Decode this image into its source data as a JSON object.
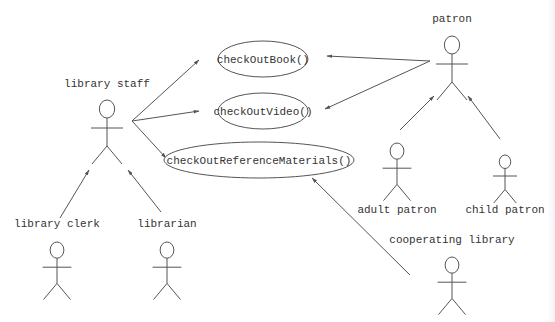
{
  "diagram": {
    "type": "UML use case diagram",
    "colors": {
      "line": "#555555",
      "text": "#333333",
      "background": "#ffffff"
    },
    "use_cases": [
      {
        "id": "checkOutBook",
        "label": "checkOutBook()",
        "cx": 263,
        "cy": 59,
        "rx": 45,
        "ry": 18
      },
      {
        "id": "checkOutVideo",
        "label": "checkOutVideo()",
        "cx": 263,
        "cy": 111,
        "rx": 45,
        "ry": 18
      },
      {
        "id": "checkOutReferenceMaterials",
        "label": "checkOutReferenceMaterials()",
        "cx": 259,
        "cy": 160,
        "rx": 95,
        "ry": 18
      }
    ],
    "actors": [
      {
        "id": "library-staff",
        "label": "library staff",
        "x": 107,
        "headY": 100,
        "scale": 1,
        "labelX": 107,
        "labelY": 87
      },
      {
        "id": "patron",
        "label": "patron",
        "x": 452,
        "headY": 36,
        "scale": 1,
        "labelX": 452,
        "labelY": 22
      },
      {
        "id": "library-clerk",
        "label": "library clerk",
        "x": 57,
        "headY": 242,
        "scale": 0.9,
        "labelX": 57,
        "labelY": 227
      },
      {
        "id": "librarian",
        "label": "librarian",
        "x": 167,
        "headY": 242,
        "scale": 0.9,
        "labelX": 167,
        "labelY": 227
      },
      {
        "id": "adult-patron",
        "label": "adult patron",
        "x": 397,
        "headY": 143,
        "scale": 0.9,
        "labelX": 397,
        "labelY": 213
      },
      {
        "id": "child-patron",
        "label": "child patron",
        "x": 505,
        "headY": 155,
        "scale": 0.75,
        "labelX": 505,
        "labelY": 213
      },
      {
        "id": "cooperating-library",
        "label": "cooperating library",
        "x": 452,
        "headY": 257,
        "scale": 0.9,
        "labelX": 452,
        "labelY": 243
      }
    ],
    "associations": [
      {
        "from": "library-staff",
        "to": "checkOutBook",
        "x1": 132,
        "y1": 121,
        "x2": 199,
        "y2": 60
      },
      {
        "from": "library-staff",
        "to": "checkOutVideo",
        "x1": 132,
        "y1": 121,
        "x2": 199,
        "y2": 111
      },
      {
        "from": "library-staff",
        "to": "checkOutReferenceMaterials",
        "x1": 132,
        "y1": 121,
        "x2": 166,
        "y2": 158
      },
      {
        "from": "patron",
        "to": "checkOutBook",
        "x1": 430,
        "y1": 61,
        "x2": 327,
        "y2": 56
      },
      {
        "from": "patron",
        "to": "checkOutVideo",
        "x1": 430,
        "y1": 61,
        "x2": 325,
        "y2": 109
      },
      {
        "from": "cooperating-library",
        "to": "checkOutReferenceMaterials",
        "x1": 410,
        "y1": 275,
        "x2": 312,
        "y2": 178
      }
    ],
    "generalizations": [
      {
        "from": "library-clerk",
        "to": "library-staff",
        "x1": 60,
        "y1": 218,
        "x2": 89,
        "y2": 170
      },
      {
        "from": "librarian",
        "to": "library-staff",
        "x1": 161,
        "y1": 212,
        "x2": 128,
        "y2": 170
      },
      {
        "from": "adult-patron",
        "to": "patron",
        "x1": 400,
        "y1": 130,
        "x2": 434,
        "y2": 96
      },
      {
        "from": "child-patron",
        "to": "patron",
        "x1": 500,
        "y1": 139,
        "x2": 468,
        "y2": 96
      }
    ]
  }
}
